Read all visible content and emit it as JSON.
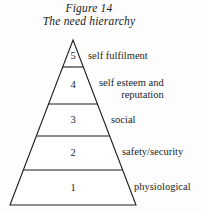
{
  "figure": {
    "caption_lines": [
      "Figure 14",
      "The need hierarchy"
    ],
    "caption_full": "Figure 14 The need hierarchy"
  },
  "diagram": {
    "type": "pyramid",
    "name": "need-hierarchy-pyramid",
    "orientation": "apex-up",
    "level_count": 5,
    "line_color": "#1d1d1d",
    "fill_color": "#ffffff",
    "background_color": "#fdfdfd"
  },
  "levels": [
    {
      "number": "5",
      "label_lines": [
        "self fulfilment"
      ],
      "label_full": "self fulfilment",
      "position_from_top": 1
    },
    {
      "number": "4",
      "label_lines": [
        "self esteem and",
        "reputation"
      ],
      "label_full": "self esteem and reputation",
      "position_from_top": 2
    },
    {
      "number": "3",
      "label_lines": [
        "social"
      ],
      "label_full": "social",
      "position_from_top": 3
    },
    {
      "number": "2",
      "label_lines": [
        "safety/security"
      ],
      "label_full": "safety/security",
      "position_from_top": 4
    },
    {
      "number": "1",
      "label_lines": [
        "physiological"
      ],
      "label_full": "physiological",
      "position_from_top": 5
    }
  ]
}
